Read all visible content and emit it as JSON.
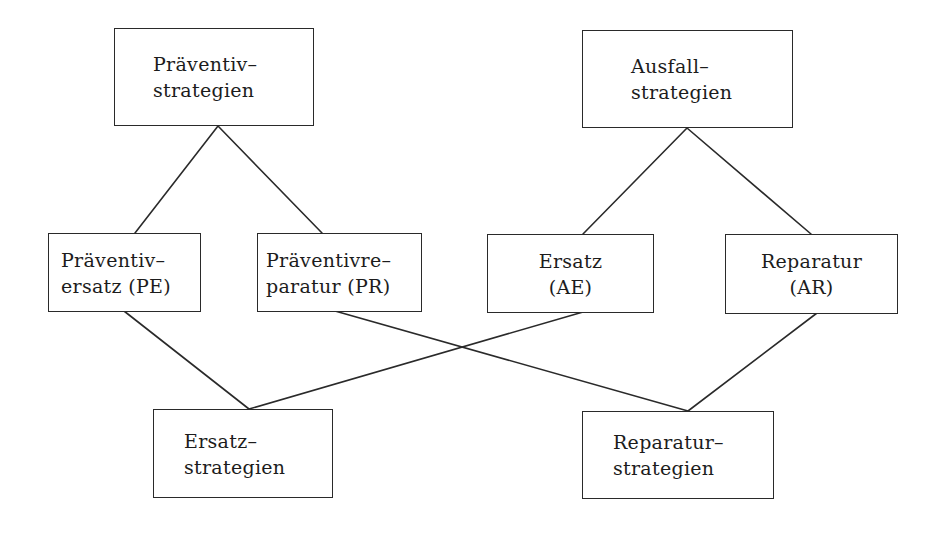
{
  "diagram": {
    "type": "hierarchy",
    "stroke_color": "#2a2a2a",
    "nodes": {
      "praeventiv": {
        "lines": [
          "Präventiv–",
          "strategien"
        ]
      },
      "ausfall": {
        "lines": [
          "Ausfall–",
          "strategien"
        ]
      },
      "pe": {
        "lines": [
          "Präventiv–",
          "ersatz (PE)"
        ]
      },
      "pr": {
        "lines": [
          "Präventivre–",
          "paratur (PR)"
        ]
      },
      "ae": {
        "lines": [
          "Ersatz",
          "(AE)"
        ]
      },
      "ar": {
        "lines": [
          "Reparatur",
          "(AR)"
        ]
      },
      "ersatz": {
        "lines": [
          "Ersatz–",
          "strategien"
        ]
      },
      "reparatur": {
        "lines": [
          "Reparatur–",
          "strategien"
        ]
      }
    },
    "edges": [
      {
        "from": "praeventiv",
        "to": "pe"
      },
      {
        "from": "praeventiv",
        "to": "pr"
      },
      {
        "from": "ausfall",
        "to": "ae"
      },
      {
        "from": "ausfall",
        "to": "ar"
      },
      {
        "from": "pe",
        "to": "ersatz"
      },
      {
        "from": "ae",
        "to": "ersatz"
      },
      {
        "from": "pr",
        "to": "reparatur"
      },
      {
        "from": "ar",
        "to": "reparatur"
      }
    ]
  }
}
